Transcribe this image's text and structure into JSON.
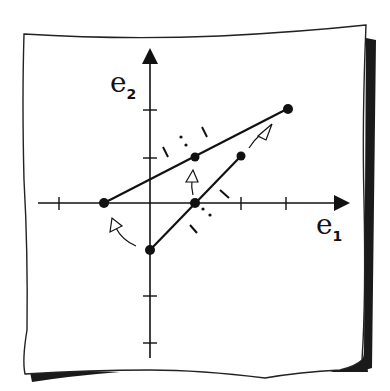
{
  "figure": {
    "axes": {
      "x_label": "e",
      "x_subscript": "1",
      "y_label": "e",
      "y_subscript": "2",
      "x_ticks": [
        -2,
        -1,
        0,
        1,
        2,
        3
      ],
      "y_ticks": [
        -3,
        -2,
        -1,
        0,
        1,
        2
      ]
    },
    "segments": [
      {
        "name": "original",
        "from": [
          0,
          -1
        ],
        "to": [
          2,
          1
        ],
        "midpoint": [
          1,
          0
        ]
      },
      {
        "name": "transformed",
        "from": [
          -1,
          0
        ],
        "to": [
          3,
          2
        ],
        "midpoint": [
          1,
          1
        ]
      }
    ],
    "arrows": [
      {
        "from": [
          0,
          -1
        ],
        "to": [
          -1,
          0
        ]
      },
      {
        "from": [
          1,
          0
        ],
        "to": [
          1,
          1
        ]
      },
      {
        "from": [
          2,
          1
        ],
        "to": [
          3,
          2
        ]
      }
    ],
    "colors": {
      "ink": "#111111",
      "paper": "#ffffff",
      "shadow": "#1a1a1a"
    }
  }
}
